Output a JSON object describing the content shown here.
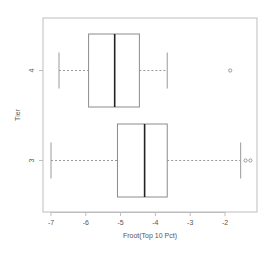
{
  "chart_data": {
    "type": "boxplot",
    "orientation": "horizontal",
    "title": "",
    "xlabel": "Froot(Top 10 Pct)",
    "ylabel": "Tier",
    "xlim": [
      -7.2,
      -1.0
    ],
    "x_ticks": [
      -7,
      -6,
      -5,
      -4,
      -3,
      -2
    ],
    "x_tick_labels": [
      "-7",
      "-6",
      "-5",
      "-4",
      "-3",
      "-2"
    ],
    "categories": [
      "3",
      "4"
    ],
    "grid": false,
    "legend": null,
    "series": [
      {
        "name": "3",
        "whisker_low": -7.0,
        "q1": -5.09,
        "median": -4.31,
        "q3": -3.66,
        "whisker_high": -1.55,
        "outliers": [
          -1.41,
          -1.27
        ]
      },
      {
        "name": "4",
        "whisker_low": -6.77,
        "q1": -5.92,
        "median": -5.17,
        "q3": -4.46,
        "whisker_high": -3.66,
        "outliers": [
          -1.85
        ]
      }
    ],
    "colors": {
      "frame": "#bdbdbd",
      "box": "#8c8c8c",
      "median": "#222222",
      "whisker": "#9a9a9a",
      "outlier": "#9a9a9a"
    }
  }
}
